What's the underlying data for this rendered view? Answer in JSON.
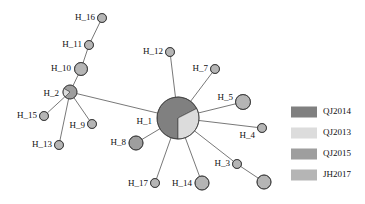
{
  "figure": {
    "type": "haplotype-network",
    "background": "#ffffff"
  },
  "chart_data": {
    "type": "network",
    "title": "",
    "palette": {
      "QJ2014": "#808080",
      "QJ2013": "#dcdcdc",
      "QJ2015": "#9e9e9e",
      "JH2017": "#b5b5b5",
      "edge": "#555555",
      "outline": "#3a3a3a"
    },
    "nodes": [
      {
        "id": "H_1",
        "label": "H_1",
        "cx": 178,
        "cy": 118,
        "r": 21,
        "label_x": 152,
        "label_y": 122,
        "anchor": "end",
        "slices": [
          {
            "group": "QJ2014",
            "start": 180,
            "sweep": 243
          },
          {
            "group": "QJ2013",
            "start": 63,
            "sweep": 117
          }
        ]
      },
      {
        "id": "H_2",
        "label": "H_2",
        "cx": 70,
        "cy": 92,
        "r": 7,
        "label_x": 59,
        "label_y": 94,
        "anchor": "end",
        "slices": [
          {
            "group": "QJ2015",
            "start": 300,
            "sweep": 285
          },
          {
            "group": "QJ2013",
            "start": 225,
            "sweep": 75
          }
        ]
      },
      {
        "id": "H_3",
        "label": "H_3",
        "cx": 237,
        "cy": 164,
        "r": 4.5,
        "label_x": 230,
        "label_y": 164,
        "anchor": "end",
        "slices": [
          {
            "group": "JH2017",
            "start": 0,
            "sweep": 360
          }
        ]
      },
      {
        "id": "H_3b",
        "label": "",
        "cx": 264,
        "cy": 182,
        "r": 7,
        "label_x": 0,
        "label_y": 0,
        "anchor": "middle",
        "slices": [
          {
            "group": "JH2017",
            "start": 0,
            "sweep": 360
          }
        ]
      },
      {
        "id": "H_4",
        "label": "H_4",
        "cx": 262,
        "cy": 128,
        "r": 4.5,
        "label_x": 255,
        "label_y": 136,
        "anchor": "end",
        "slices": [
          {
            "group": "JH2017",
            "start": 0,
            "sweep": 360
          }
        ]
      },
      {
        "id": "H_5",
        "label": "H_5",
        "cx": 243,
        "cy": 102,
        "r": 7.5,
        "label_x": 233,
        "label_y": 98,
        "anchor": "end",
        "slices": [
          {
            "group": "JH2017",
            "start": 0,
            "sweep": 360
          }
        ]
      },
      {
        "id": "H_7",
        "label": "H_7",
        "cx": 215,
        "cy": 69,
        "r": 4.5,
        "label_x": 208,
        "label_y": 69,
        "anchor": "end",
        "slices": [
          {
            "group": "JH2017",
            "start": 0,
            "sweep": 360
          }
        ]
      },
      {
        "id": "H_8",
        "label": "H_8",
        "cx": 136,
        "cy": 143,
        "r": 7,
        "label_x": 126,
        "label_y": 143,
        "anchor": "end",
        "slices": [
          {
            "group": "QJ2015",
            "start": 0,
            "sweep": 360
          }
        ]
      },
      {
        "id": "H_9",
        "label": "H_9",
        "cx": 92,
        "cy": 124,
        "r": 4.5,
        "label_x": 85,
        "label_y": 126,
        "anchor": "end",
        "slices": [
          {
            "group": "JH2017",
            "start": 0,
            "sweep": 360
          }
        ]
      },
      {
        "id": "H_10",
        "label": "H_10",
        "cx": 81,
        "cy": 69,
        "r": 6.5,
        "label_x": 71,
        "label_y": 69,
        "anchor": "end",
        "slices": [
          {
            "group": "JH2017",
            "start": 0,
            "sweep": 360
          }
        ]
      },
      {
        "id": "H_11",
        "label": "H_11",
        "cx": 89,
        "cy": 45,
        "r": 4.5,
        "label_x": 82,
        "label_y": 45,
        "anchor": "end",
        "slices": [
          {
            "group": "JH2017",
            "start": 0,
            "sweep": 360
          }
        ]
      },
      {
        "id": "H_12",
        "label": "H_12",
        "cx": 170,
        "cy": 52,
        "r": 4.5,
        "label_x": 163,
        "label_y": 52,
        "anchor": "end",
        "slices": [
          {
            "group": "JH2017",
            "start": 0,
            "sweep": 360
          }
        ]
      },
      {
        "id": "H_13",
        "label": "H_13",
        "cx": 59,
        "cy": 145,
        "r": 4.5,
        "label_x": 52,
        "label_y": 145,
        "anchor": "end",
        "slices": [
          {
            "group": "JH2017",
            "start": 0,
            "sweep": 360
          }
        ]
      },
      {
        "id": "H_14",
        "label": "H_14",
        "cx": 202,
        "cy": 183,
        "r": 7,
        "label_x": 192,
        "label_y": 184,
        "anchor": "end",
        "slices": [
          {
            "group": "JH2017",
            "start": 0,
            "sweep": 360
          }
        ]
      },
      {
        "id": "H_15",
        "label": "H_15",
        "cx": 44,
        "cy": 116,
        "r": 4.5,
        "label_x": 37,
        "label_y": 116,
        "anchor": "end",
        "slices": [
          {
            "group": "JH2017",
            "start": 0,
            "sweep": 360
          }
        ]
      },
      {
        "id": "H_16",
        "label": "H_16",
        "cx": 102,
        "cy": 18,
        "r": 4.5,
        "label_x": 95,
        "label_y": 18,
        "anchor": "end",
        "slices": [
          {
            "group": "JH2017",
            "start": 0,
            "sweep": 360
          }
        ]
      },
      {
        "id": "H_17",
        "label": "H_17",
        "cx": 155,
        "cy": 183,
        "r": 4.5,
        "label_x": 148,
        "label_y": 184,
        "anchor": "end",
        "slices": [
          {
            "group": "JH2017",
            "start": 0,
            "sweep": 360
          }
        ]
      }
    ],
    "edges": [
      {
        "from": "H_16",
        "to": "H_11"
      },
      {
        "from": "H_11",
        "to": "H_10"
      },
      {
        "from": "H_10",
        "to": "H_2"
      },
      {
        "from": "H_2",
        "to": "H_15"
      },
      {
        "from": "H_2",
        "to": "H_9"
      },
      {
        "from": "H_2",
        "to": "H_13"
      },
      {
        "from": "H_2",
        "to": "H_1"
      },
      {
        "from": "H_1",
        "to": "H_12"
      },
      {
        "from": "H_1",
        "to": "H_7"
      },
      {
        "from": "H_1",
        "to": "H_5"
      },
      {
        "from": "H_1",
        "to": "H_4"
      },
      {
        "from": "H_1",
        "to": "H_8"
      },
      {
        "from": "H_1",
        "to": "H_17"
      },
      {
        "from": "H_1",
        "to": "H_14"
      },
      {
        "from": "H_1",
        "to": "H_3"
      },
      {
        "from": "H_3",
        "to": "H_3b"
      }
    ]
  },
  "legend": {
    "position": "right",
    "swatch": {
      "x": 291,
      "width": 26,
      "height": 11,
      "label_x": 323
    },
    "items": [
      {
        "label": "QJ2014",
        "color": "#808080",
        "y": 112
      },
      {
        "label": "QJ2013",
        "color": "#dcdcdc",
        "y": 133
      },
      {
        "label": "QJ2015",
        "color": "#9e9e9e",
        "y": 154
      },
      {
        "label": "JH2017",
        "color": "#b5b5b5",
        "y": 175
      }
    ]
  }
}
